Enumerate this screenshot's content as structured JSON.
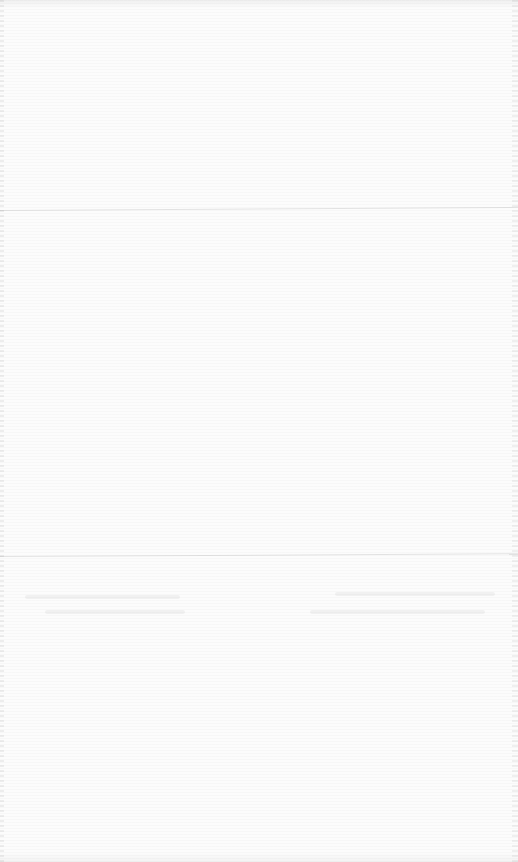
{
  "document": {
    "visible_text": [],
    "background_color": "#fcfcfc",
    "note_rules": 2
  }
}
